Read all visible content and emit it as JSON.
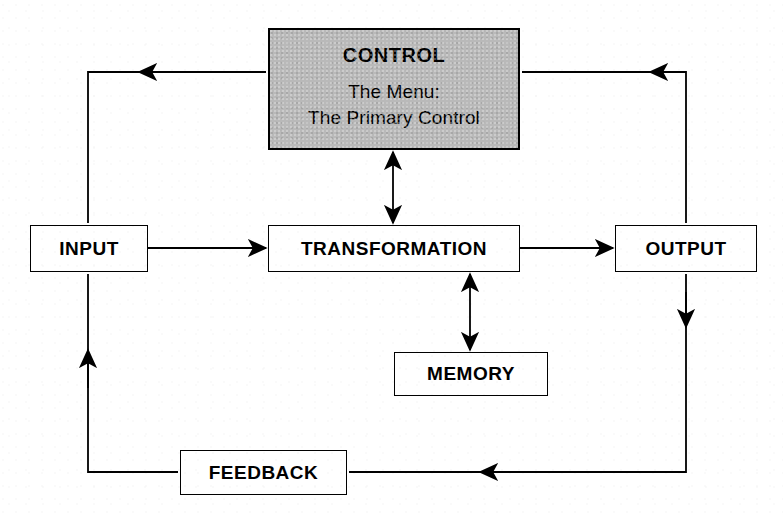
{
  "diagram": {
    "type": "flowchart",
    "colors": {
      "stroke": "#000000",
      "background": "#ffffff",
      "control_fill": "#b9b9b9"
    },
    "nodes": [
      {
        "id": "control",
        "title": "CONTROL",
        "sub_line1": "The Menu:",
        "sub_line2": "The Primary Control",
        "shaded": true
      },
      {
        "id": "input",
        "title": "INPUT",
        "shaded": false
      },
      {
        "id": "transformation",
        "title": "TRANSFORMATION",
        "shaded": false
      },
      {
        "id": "output",
        "title": "OUTPUT",
        "shaded": false
      },
      {
        "id": "memory",
        "title": "MEMORY",
        "shaded": false
      },
      {
        "id": "feedback",
        "title": "FEEDBACK",
        "shaded": false
      }
    ],
    "edges": [
      {
        "id": "input-to-transformation",
        "from": "input",
        "to": "transformation",
        "arrow": "single"
      },
      {
        "id": "transformation-to-output",
        "from": "transformation",
        "to": "output",
        "arrow": "single"
      },
      {
        "id": "control-transformation",
        "from": "control",
        "to": "transformation",
        "arrow": "double"
      },
      {
        "id": "transformation-memory",
        "from": "transformation",
        "to": "memory",
        "arrow": "double"
      },
      {
        "id": "control-to-input-loop",
        "from": "control",
        "to": "input",
        "arrow": "single"
      },
      {
        "id": "output-to-control-loop",
        "from": "output",
        "to": "control",
        "arrow": "single"
      },
      {
        "id": "output-to-feedback",
        "from": "output",
        "to": "feedback",
        "arrow": "single"
      },
      {
        "id": "feedback-to-input",
        "from": "feedback",
        "to": "input",
        "arrow": "single"
      }
    ]
  }
}
